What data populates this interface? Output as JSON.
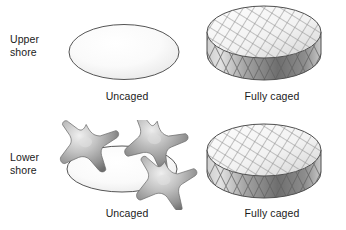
{
  "figure": {
    "background_color": "#ffffff",
    "outline_color": "#555555",
    "width": 346,
    "height": 230
  },
  "rows": [
    {
      "id": "upper-shore",
      "label": "Upper\nshore",
      "treatments": [
        {
          "id": "upper-uncaged",
          "caption": "Uncaged",
          "shape": "ellipse-plot",
          "caged": false,
          "mesh": false,
          "starfish_count": 0
        },
        {
          "id": "upper-caged",
          "caption": "Fully caged",
          "shape": "mesh-cylinder",
          "caged": true,
          "mesh": true,
          "starfish_count": 0
        }
      ]
    },
    {
      "id": "lower-shore",
      "label": "Lower\nshore",
      "treatments": [
        {
          "id": "lower-uncaged",
          "caption": "Uncaged",
          "shape": "ellipse-plot",
          "caged": false,
          "mesh": false,
          "starfish_count": 3
        },
        {
          "id": "lower-caged",
          "caption": "Fully caged",
          "shape": "mesh-cylinder",
          "caged": true,
          "mesh": true,
          "starfish_count": 0
        }
      ]
    }
  ],
  "colors": {
    "outline": "#555555",
    "mesh_line": "#7d7d7d",
    "cylinder_top_light": "#fbfbfb",
    "cylinder_top_shade": "#d9d9d9",
    "cylinder_side_light": "#d2d2d2",
    "cylinder_side_dark": "#6e6e6e",
    "plate_fill_light": "#fdfdfd",
    "plate_fill_shade": "#e9e9e9",
    "starfish_light": "#e2e2e2",
    "starfish_mid": "#a8a8a8",
    "starfish_dark": "#6f6f6f",
    "text": "#1a1a1a"
  }
}
